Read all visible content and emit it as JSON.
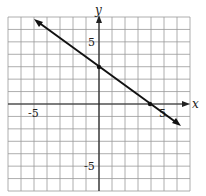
{
  "chart_data": {
    "type": "line",
    "title": "",
    "xlabel": "x",
    "ylabel": "y",
    "xlim": [
      -7,
      7
    ],
    "ylim": [
      -7,
      7
    ],
    "grid": true,
    "tick_labels": {
      "x": [
        {
          "value": -5,
          "label": "-5"
        },
        {
          "value": 5,
          "label": "5"
        }
      ],
      "y": [
        {
          "value": 5,
          "label": "5"
        },
        {
          "value": -5,
          "label": "-5"
        }
      ]
    },
    "series": [
      {
        "name": "line",
        "equation": "y = -3/4 x + 3",
        "slope": -0.75,
        "intercept": 3,
        "x": [
          -5,
          0,
          4,
          6.3
        ],
        "y": [
          6.75,
          3,
          0,
          -1.7
        ],
        "marked_points": [
          {
            "x": 0,
            "y": 3
          },
          {
            "x": 4,
            "y": 0
          }
        ],
        "arrows_both_ends": true
      }
    ]
  },
  "labels": {
    "x_axis": "x",
    "y_axis": "y",
    "x_neg5": "-5",
    "x_pos5": "5",
    "y_pos5": "5",
    "y_neg5": "-5"
  }
}
